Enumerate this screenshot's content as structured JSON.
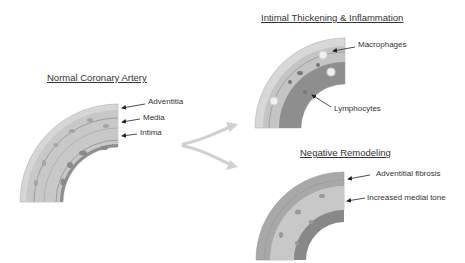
{
  "panels": {
    "normal": {
      "title": "Normal Coronary Artery",
      "labels": [
        "Adventitia",
        "Media",
        "Intima"
      ]
    },
    "inflammation": {
      "title": "Intimal Thickening & Inflammation",
      "labels": [
        "Macrophages",
        "Lymphocytes"
      ]
    },
    "remodeling": {
      "title": "Negative Remodeling",
      "labels": [
        "Adventitial fibrosis",
        "Increased medial tone"
      ]
    }
  },
  "colors": {
    "adventitia": "#d4d4d4",
    "media": "#c2c2c2",
    "intima": "#9a9a9a",
    "thickened_intima": "#8c8c8c",
    "fibrosis": "#a8a8a8",
    "arrow": "#d0d0d0",
    "text": "#333333"
  }
}
